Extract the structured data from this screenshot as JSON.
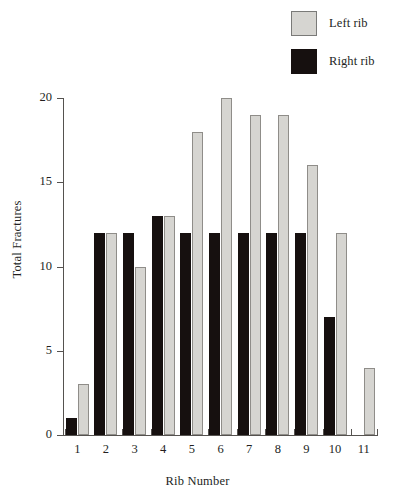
{
  "chart_data": {
    "type": "bar",
    "title": "",
    "xlabel": "Rib Number",
    "ylabel": "Total Fractures",
    "categories": [
      "1",
      "2",
      "3",
      "4",
      "5",
      "6",
      "7",
      "8",
      "9",
      "10",
      "11"
    ],
    "series": [
      {
        "name": "Right rib",
        "color": "#16100f",
        "values": [
          1,
          12,
          12,
          13,
          12,
          12,
          12,
          12,
          12,
          7,
          0
        ]
      },
      {
        "name": "Left rib",
        "color": "#d6d5d1",
        "values": [
          3,
          12,
          10,
          13,
          18,
          20,
          19,
          19,
          16,
          12,
          4
        ]
      }
    ],
    "ylim": [
      0,
      20
    ],
    "yticks": [
      0,
      5,
      10,
      15,
      20
    ],
    "ytick_labels": [
      "0",
      "5",
      "10",
      "15",
      "20"
    ],
    "grid": false,
    "legend_position": "top-right",
    "bar_order": [
      "Right rib",
      "Left rib"
    ]
  },
  "legend": {
    "items": [
      {
        "label": "Left rib",
        "color": "#d6d5d1",
        "swatch": "legend-swatch-left-rib"
      },
      {
        "label": "Right rib",
        "color": "#16100f",
        "swatch": "legend-swatch-right-rib"
      }
    ]
  }
}
